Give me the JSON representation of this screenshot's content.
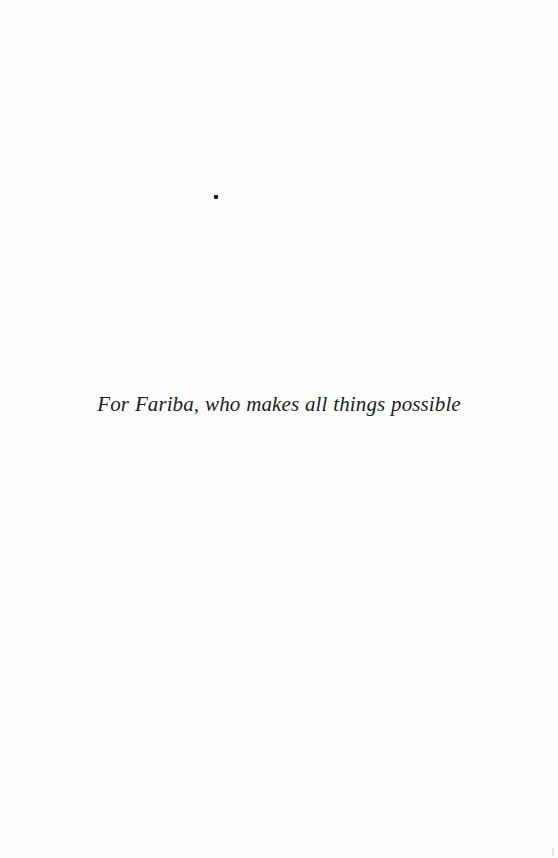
{
  "page": {
    "dedication": "For Fariba, who makes all things possible",
    "background_color": "#fefefe",
    "text_color": "#1c1c1c"
  }
}
